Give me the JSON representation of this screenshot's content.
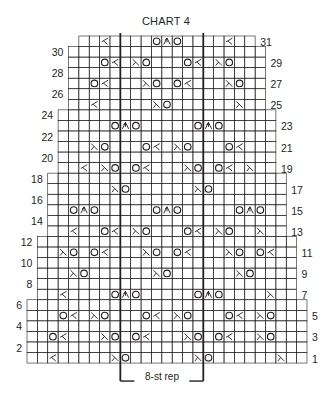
{
  "title": "CHART 4",
  "repeat_label": "8-st rep",
  "colors": {
    "grid": "#231f20",
    "background": "#ffffff",
    "symbol": "#231f20"
  },
  "grid": {
    "origin_x": 27,
    "top_y": 36,
    "cell_w": 10.37,
    "row_h": 10.55,
    "total_rows": 31,
    "max_cols": 27,
    "repeat_cols": [
      9,
      17
    ],
    "bands": [
      {
        "rows": [
          1,
          6
        ],
        "cols": [
          0,
          26
        ]
      },
      {
        "rows": [
          7,
          12
        ],
        "cols": [
          1,
          25
        ]
      },
      {
        "rows": [
          13,
          18
        ],
        "cols": [
          2,
          24
        ]
      },
      {
        "rows": [
          19,
          24
        ],
        "cols": [
          3,
          23
        ]
      },
      {
        "rows": [
          25,
          30
        ],
        "cols": [
          4,
          22
        ]
      },
      {
        "rows": [
          31,
          31
        ],
        "cols": [
          5,
          21
        ]
      }
    ]
  },
  "legend_symbols": {
    "O": "yo",
    "k2tog": "k2tog",
    "ssk": "ssk",
    "s2kp": "centered double decrease"
  },
  "rows": {
    "1": [
      [
        2,
        "k2tog"
      ],
      [
        8,
        "ssk"
      ],
      [
        9,
        "O"
      ],
      [
        16,
        "ssk"
      ],
      [
        17,
        "O"
      ],
      [
        24,
        "ssk"
      ]
    ],
    "3": [
      [
        2,
        "O"
      ],
      [
        3,
        "k2tog"
      ],
      [
        7,
        "ssk"
      ],
      [
        8,
        "O"
      ],
      [
        10,
        "O"
      ],
      [
        11,
        "k2tog"
      ],
      [
        15,
        "ssk"
      ],
      [
        16,
        "O"
      ],
      [
        18,
        "O"
      ],
      [
        19,
        "k2tog"
      ],
      [
        22,
        "ssk"
      ],
      [
        23,
        "O"
      ]
    ],
    "5": [
      [
        3,
        "O"
      ],
      [
        4,
        "k2tog"
      ],
      [
        6,
        "ssk"
      ],
      [
        7,
        "O"
      ],
      [
        11,
        "O"
      ],
      [
        12,
        "k2tog"
      ],
      [
        14,
        "ssk"
      ],
      [
        15,
        "O"
      ],
      [
        19,
        "O"
      ],
      [
        20,
        "k2tog"
      ],
      [
        22,
        "ssk"
      ],
      [
        23,
        "O"
      ]
    ],
    "7": [
      [
        3,
        "k2tog"
      ],
      [
        8,
        "O"
      ],
      [
        9,
        "s2kp"
      ],
      [
        10,
        "O"
      ],
      [
        16,
        "O"
      ],
      [
        17,
        "s2kp"
      ],
      [
        18,
        "O"
      ],
      [
        23,
        "ssk"
      ]
    ],
    "9": [
      [
        4,
        "ssk"
      ],
      [
        5,
        "O"
      ],
      [
        12,
        "ssk"
      ],
      [
        13,
        "O"
      ],
      [
        20,
        "ssk"
      ],
      [
        21,
        "O"
      ]
    ],
    "11": [
      [
        3,
        "ssk"
      ],
      [
        4,
        "O"
      ],
      [
        6,
        "O"
      ],
      [
        7,
        "k2tog"
      ],
      [
        11,
        "ssk"
      ],
      [
        12,
        "O"
      ],
      [
        14,
        "O"
      ],
      [
        15,
        "k2tog"
      ],
      [
        19,
        "ssk"
      ],
      [
        20,
        "O"
      ],
      [
        22,
        "O"
      ],
      [
        23,
        "k2tog"
      ]
    ],
    "13": [
      [
        4,
        "k2tog"
      ],
      [
        7,
        "O"
      ],
      [
        8,
        "k2tog"
      ],
      [
        10,
        "ssk"
      ],
      [
        11,
        "O"
      ],
      [
        15,
        "O"
      ],
      [
        16,
        "k2tog"
      ],
      [
        18,
        "ssk"
      ],
      [
        19,
        "O"
      ],
      [
        22,
        "ssk"
      ]
    ],
    "15": [
      [
        4,
        "O"
      ],
      [
        5,
        "s2kp"
      ],
      [
        6,
        "O"
      ],
      [
        12,
        "O"
      ],
      [
        13,
        "s2kp"
      ],
      [
        14,
        "O"
      ],
      [
        20,
        "O"
      ],
      [
        21,
        "s2kp"
      ],
      [
        22,
        "O"
      ]
    ],
    "17": [
      [
        8,
        "ssk"
      ],
      [
        9,
        "O"
      ],
      [
        16,
        "ssk"
      ],
      [
        17,
        "O"
      ]
    ],
    "19": [
      [
        5,
        "k2tog"
      ],
      [
        7,
        "ssk"
      ],
      [
        8,
        "O"
      ],
      [
        10,
        "O"
      ],
      [
        11,
        "k2tog"
      ],
      [
        15,
        "ssk"
      ],
      [
        16,
        "O"
      ],
      [
        18,
        "O"
      ],
      [
        19,
        "k2tog"
      ],
      [
        21,
        "ssk"
      ]
    ],
    "21": [
      [
        6,
        "ssk"
      ],
      [
        7,
        "O"
      ],
      [
        11,
        "O"
      ],
      [
        12,
        "k2tog"
      ],
      [
        14,
        "ssk"
      ],
      [
        15,
        "O"
      ],
      [
        19,
        "O"
      ],
      [
        20,
        "k2tog"
      ]
    ],
    "23": [
      [
        8,
        "O"
      ],
      [
        9,
        "s2kp"
      ],
      [
        10,
        "O"
      ],
      [
        16,
        "O"
      ],
      [
        17,
        "s2kp"
      ],
      [
        18,
        "O"
      ]
    ],
    "25": [
      [
        6,
        "k2tog"
      ],
      [
        12,
        "ssk"
      ],
      [
        13,
        "O"
      ],
      [
        20,
        "ssk"
      ]
    ],
    "27": [
      [
        6,
        "O"
      ],
      [
        7,
        "k2tog"
      ],
      [
        11,
        "ssk"
      ],
      [
        12,
        "O"
      ],
      [
        14,
        "O"
      ],
      [
        15,
        "k2tog"
      ],
      [
        19,
        "ssk"
      ],
      [
        20,
        "O"
      ]
    ],
    "29": [
      [
        7,
        "O"
      ],
      [
        8,
        "k2tog"
      ],
      [
        10,
        "ssk"
      ],
      [
        11,
        "O"
      ],
      [
        15,
        "O"
      ],
      [
        16,
        "k2tog"
      ],
      [
        18,
        "ssk"
      ],
      [
        19,
        "O"
      ]
    ],
    "31": [
      [
        7,
        "k2tog"
      ],
      [
        12,
        "O"
      ],
      [
        13,
        "s2kp"
      ],
      [
        14,
        "O"
      ],
      [
        19,
        "k2tog"
      ]
    ]
  },
  "row_labels": {
    "left": [
      "2",
      "4",
      "6",
      "8",
      "10",
      "12",
      "14",
      "16",
      "18",
      "20",
      "22",
      "24",
      "26",
      "28",
      "30"
    ],
    "right": [
      "1",
      "3",
      "5",
      "7",
      "9",
      "11",
      "13",
      "15",
      "17",
      "19",
      "21",
      "23",
      "25",
      "27",
      "29",
      "31"
    ]
  }
}
